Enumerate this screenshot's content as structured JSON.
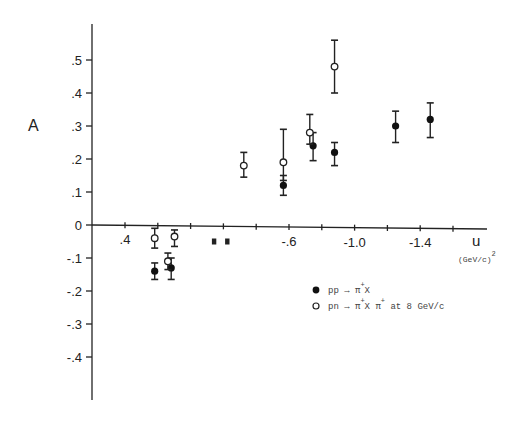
{
  "chart_data": {
    "type": "scatter",
    "title": "",
    "xlabel": "u",
    "xlabel_unit": "(GeV/c)",
    "xlabel_unit_sup": "2",
    "ylabel": "A",
    "x_ticks": [
      {
        "pos": 0,
        "label": ".4"
      },
      {
        "pos": 1,
        "label": ""
      },
      {
        "pos": 2,
        "label": ""
      },
      {
        "pos": 3,
        "label": ""
      },
      {
        "pos": 4,
        "label": ""
      },
      {
        "pos": 5,
        "label": "-.6"
      },
      {
        "pos": 6,
        "label": ""
      },
      {
        "pos": 7,
        "label": "-1.0"
      },
      {
        "pos": 8,
        "label": ""
      },
      {
        "pos": 9,
        "label": "-1.4"
      },
      {
        "pos": 10,
        "label": ""
      }
    ],
    "y_ticks": [
      {
        "value": 0.5,
        "label": ".5"
      },
      {
        "value": 0.4,
        "label": ".4"
      },
      {
        "value": 0.3,
        "label": ".3"
      },
      {
        "value": 0.2,
        "label": ".2"
      },
      {
        "value": 0.1,
        "label": ".1"
      },
      {
        "value": 0.0,
        "label": "0"
      },
      {
        "value": -0.1,
        "label": "-.1"
      },
      {
        "value": -0.2,
        "label": "-.2"
      },
      {
        "value": -0.3,
        "label": "-.3"
      },
      {
        "value": -0.4,
        "label": "-.4"
      }
    ],
    "ylim": [
      -0.53,
      0.6
    ],
    "grid": false,
    "legend_position": "lower right",
    "series": [
      {
        "name": "pp → π⁺X",
        "marker": "filled-circle",
        "points": [
          {
            "u": 0.22,
            "A": -0.14,
            "err_lo": 0.025,
            "err_hi": 0.025
          },
          {
            "u": 0.12,
            "A": -0.13,
            "err_lo": 0.035,
            "err_hi": 0.03
          },
          {
            "u": -0.56,
            "A": 0.12,
            "err_lo": 0.03,
            "err_hi": 0.03
          },
          {
            "u": -0.74,
            "A": 0.24,
            "err_lo": 0.045,
            "err_hi": 0.04
          },
          {
            "u": -0.87,
            "A": 0.22,
            "err_lo": 0.04,
            "err_hi": 0.03
          },
          {
            "u": -1.24,
            "A": 0.3,
            "err_lo": 0.05,
            "err_hi": 0.045
          },
          {
            "u": -1.45,
            "A": 0.32,
            "err_lo": 0.055,
            "err_hi": 0.05
          }
        ]
      },
      {
        "name": "pn → π⁺X  π⁺ at 8 GeV/c",
        "marker": "open-circle",
        "points": [
          {
            "u": 0.22,
            "A": -0.04,
            "err_lo": 0.03,
            "err_hi": 0.03
          },
          {
            "u": 0.1,
            "A": -0.035,
            "err_lo": 0.03,
            "err_hi": 0.02
          },
          {
            "u": 0.14,
            "A": -0.11,
            "err_lo": 0.025,
            "err_hi": 0.025
          },
          {
            "u": -0.32,
            "A": 0.18,
            "err_lo": 0.035,
            "err_hi": 0.04
          },
          {
            "u": -0.56,
            "A": 0.19,
            "err_lo": 0.055,
            "err_hi": 0.1
          },
          {
            "u": -0.72,
            "A": 0.28,
            "err_lo": 0.035,
            "err_hi": 0.055
          },
          {
            "u": -0.87,
            "A": 0.48,
            "err_lo": 0.08,
            "err_hi": 0.08
          }
        ]
      },
      {
        "name": "unlabeled small markers",
        "marker": "small-square",
        "points": [
          {
            "u": -0.14,
            "A": -0.05
          },
          {
            "u": -0.22,
            "A": -0.05
          }
        ]
      }
    ]
  },
  "legend": {
    "items": [
      {
        "marker": "filled",
        "text": "pp → π",
        "sup": "+",
        "tail": "X"
      },
      {
        "marker": "open",
        "text": "pn → π",
        "sup": "+",
        "tail": "X   π",
        "sup2": "+",
        "tail2": " at 8 GeV/c"
      }
    ]
  }
}
